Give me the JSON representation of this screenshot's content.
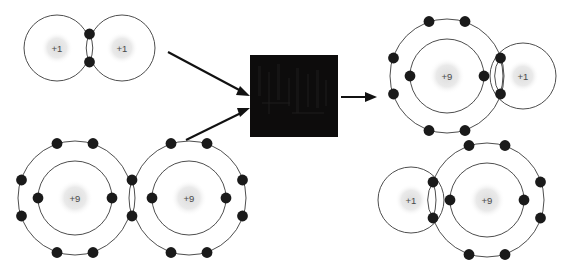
{
  "diagram": {
    "background_color": "#ffffff",
    "shell_color": "#3a3a3a",
    "electron_color": "#1a1a1a",
    "nucleus_halo_color": "#e2e2e2",
    "nucleus_label_color": "#4a4a4a",
    "arrow_color": "#111111",
    "redaction_color": "#0d0c0c"
  },
  "reactants": {
    "hydrogen_molecule": {
      "name": "hydrogen-molecule",
      "formula": "H2",
      "atoms": [
        {
          "label": "+1",
          "element": "hydrogen",
          "shells": 1,
          "outer_electrons": 1
        },
        {
          "label": "+1",
          "element": "hydrogen",
          "shells": 1,
          "outer_electrons": 1
        }
      ],
      "shared_electrons": 2,
      "bond_type": "single covalent"
    },
    "fluorine_molecule": {
      "name": "fluorine-molecule",
      "formula": "F2",
      "atoms": [
        {
          "label": "+9",
          "element": "fluorine",
          "shells": 2,
          "inner_electrons": 2,
          "outer_electrons": 7
        },
        {
          "label": "+9",
          "element": "fluorine",
          "shells": 2,
          "inner_electrons": 2,
          "outer_electrons": 7
        }
      ],
      "shared_electrons": 2,
      "bond_type": "single covalent"
    }
  },
  "products": {
    "hydrogen_fluoride_top": {
      "name": "hydrogen-fluoride-molecule-top",
      "formula": "HF",
      "atoms": [
        {
          "label": "+9",
          "element": "fluorine",
          "shells": 2,
          "inner_electrons": 2,
          "outer_electrons": 7
        },
        {
          "label": "+1",
          "element": "hydrogen",
          "shells": 1,
          "outer_electrons": 1
        }
      ],
      "shared_electrons": 2,
      "bond_type": "single covalent",
      "orientation": "fluorine-left"
    },
    "hydrogen_fluoride_bottom": {
      "name": "hydrogen-fluoride-molecule-bottom",
      "formula": "HF",
      "atoms": [
        {
          "label": "+1",
          "element": "hydrogen",
          "shells": 1,
          "outer_electrons": 1
        },
        {
          "label": "+9",
          "element": "fluorine",
          "shells": 2,
          "inner_electrons": 2,
          "outer_electrons": 7
        }
      ],
      "shared_electrons": 2,
      "bond_type": "single covalent",
      "orientation": "fluorine-right"
    }
  },
  "reaction_box": {
    "name": "redacted-reaction-box",
    "label": "",
    "state": "redacted",
    "note": "solid black censored square"
  },
  "arrows": [
    {
      "name": "arrow-hydrogen-to-box",
      "from": "hydrogen-molecule",
      "to": "redacted-reaction-box",
      "direction": "down-right"
    },
    {
      "name": "arrow-fluorine-to-box",
      "from": "fluorine-molecule",
      "to": "redacted-reaction-box",
      "direction": "up-right"
    },
    {
      "name": "arrow-box-to-product",
      "from": "redacted-reaction-box",
      "to": "hydrogen-fluoride-molecule-top",
      "direction": "right"
    }
  ]
}
